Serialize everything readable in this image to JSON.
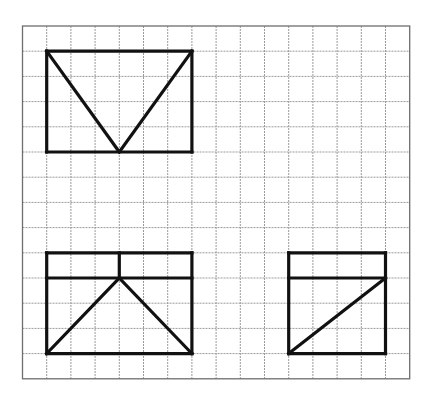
{
  "grid": {
    "origin_px": [
      22.5,
      26
    ],
    "cell_w": 24.2,
    "cell_h": 25.2,
    "cols": 16,
    "rows": 14,
    "line_color": "#9a9a9a",
    "border_color": "#6e6e6e"
  },
  "shapes": [
    {
      "name": "top-view-rectangle",
      "stroke": "#111111",
      "segments": [
        [
          [
            1,
            1
          ],
          [
            7,
            1
          ]
        ],
        [
          [
            7,
            1
          ],
          [
            7,
            5
          ]
        ],
        [
          [
            7,
            5
          ],
          [
            1,
            5
          ]
        ],
        [
          [
            1,
            5
          ],
          [
            1,
            1
          ]
        ],
        [
          [
            1,
            1
          ],
          [
            4,
            5
          ]
        ],
        [
          [
            4,
            5
          ],
          [
            7,
            1
          ]
        ]
      ]
    },
    {
      "name": "front-view-rectangle",
      "stroke": "#111111",
      "segments": [
        [
          [
            1,
            9
          ],
          [
            7,
            9
          ]
        ],
        [
          [
            7,
            9
          ],
          [
            7,
            13
          ]
        ],
        [
          [
            7,
            13
          ],
          [
            1,
            13
          ]
        ],
        [
          [
            1,
            13
          ],
          [
            1,
            9
          ]
        ],
        [
          [
            1,
            10
          ],
          [
            7,
            10
          ]
        ],
        [
          [
            4,
            9
          ],
          [
            4,
            10
          ]
        ],
        [
          [
            1,
            13
          ],
          [
            4,
            10
          ]
        ],
        [
          [
            4,
            10
          ],
          [
            7,
            13
          ]
        ]
      ]
    },
    {
      "name": "side-view-rectangle",
      "stroke": "#111111",
      "segments": [
        [
          [
            11,
            9
          ],
          [
            15,
            9
          ]
        ],
        [
          [
            15,
            9
          ],
          [
            15,
            13
          ]
        ],
        [
          [
            15,
            13
          ],
          [
            11,
            13
          ]
        ],
        [
          [
            11,
            13
          ],
          [
            11,
            9
          ]
        ],
        [
          [
            11,
            10
          ],
          [
            15,
            10
          ]
        ],
        [
          [
            11,
            13
          ],
          [
            15,
            10
          ]
        ]
      ]
    }
  ]
}
